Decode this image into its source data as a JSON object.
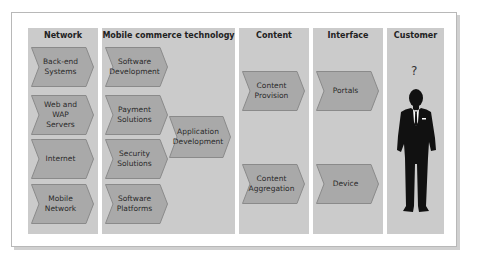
{
  "columns": [
    {
      "title": "Network",
      "items": [
        "Back-end Systems",
        "Web and WAP Servers",
        "Internet",
        "Mobile Network"
      ]
    },
    {
      "title": "Mobile commerce technology",
      "items": [
        "Software Development",
        "Payment Solutions",
        "Security Solutions",
        "Software Platforms"
      ],
      "extra": "Application Development"
    },
    {
      "title": "Content",
      "items": [
        "Content Provision",
        "Content Aggregation"
      ]
    },
    {
      "title": "Interface",
      "items": [
        "Portals",
        "Device"
      ]
    },
    {
      "title": "Customer",
      "symbol": "?",
      "figure": "businessman-silhouette"
    }
  ],
  "colors": {
    "column_bg": "#cbcbcb",
    "chevron_fill": "#a9a9a9",
    "chevron_stroke": "#8a8a8a",
    "figure": "#111111"
  }
}
